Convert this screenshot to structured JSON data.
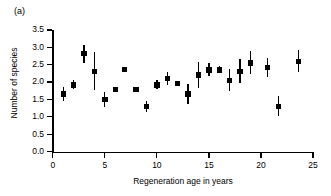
{
  "panel": {
    "label": "(a)"
  },
  "chart_data": {
    "type": "scatter",
    "title": "",
    "subtitle": "",
    "xlabel": "Regeneration age in years",
    "ylabel": "Number of species",
    "xlim": [
      0,
      25
    ],
    "ylim": [
      0.0,
      3.5
    ],
    "xticks": [
      0,
      5,
      10,
      15,
      20,
      25
    ],
    "xtick_labels": [
      "0",
      "5",
      "10",
      "15",
      "20",
      "25"
    ],
    "yticks": [
      0.0,
      0.5,
      1.0,
      1.5,
      2.0,
      2.5,
      3.0,
      3.5
    ],
    "ytick_labels": [
      "0.0",
      "0.5",
      "1.0",
      "1.5",
      "2.0",
      "2.5",
      "3.0",
      "3.5"
    ],
    "grid": false,
    "legend": null,
    "marker_color": "#000000",
    "errorbar_color": "#000000",
    "series": [
      {
        "name": "Number of species",
        "x": [
          1.0,
          2.0,
          3.0,
          4.0,
          5.0,
          6.0,
          6.9,
          8.0,
          9.0,
          10.0,
          11.0,
          12.0,
          13.0,
          14.0,
          15.0,
          16.0,
          17.0,
          18.0,
          19.0,
          20.6,
          21.7,
          23.6
        ],
        "y": [
          1.66,
          1.92,
          2.82,
          2.3,
          1.5,
          1.78,
          2.37,
          1.78,
          1.3,
          1.92,
          2.1,
          1.95,
          1.66,
          2.2,
          2.35,
          2.35,
          2.05,
          2.3,
          2.55,
          2.42,
          1.3,
          2.6
        ],
        "yerr_low": [
          0.2,
          0.12,
          0.26,
          0.54,
          0.22,
          0.08,
          0.03,
          0.08,
          0.16,
          0.12,
          0.18,
          0.05,
          0.28,
          0.36,
          0.18,
          0.1,
          0.3,
          0.34,
          0.32,
          0.26,
          0.28,
          0.3
        ],
        "yerr_high": [
          0.2,
          0.14,
          0.26,
          0.56,
          0.22,
          0.08,
          0.03,
          0.08,
          0.16,
          0.14,
          0.2,
          0.05,
          0.28,
          0.38,
          0.2,
          0.1,
          0.32,
          0.36,
          0.34,
          0.26,
          0.3,
          0.32
        ]
      }
    ]
  }
}
